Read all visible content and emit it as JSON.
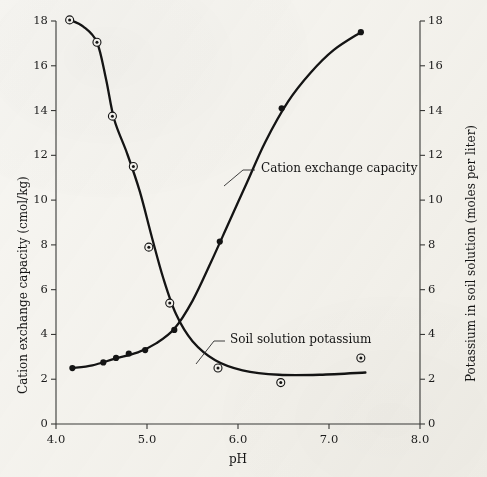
{
  "figure": {
    "background_color": "#f7f6f2",
    "ink_color": "#141414"
  },
  "axes": {
    "x": {
      "label": "pH",
      "min": 4.0,
      "max": 8.0,
      "ticks": [
        "4.0",
        "5.0",
        "6.0",
        "7.0",
        "8.0"
      ],
      "tick_values": [
        4.0,
        5.0,
        6.0,
        7.0,
        8.0
      ]
    },
    "y_left": {
      "label": "Cation exchange capacity (cmol/kg)",
      "min": 0,
      "max": 18,
      "ticks": [
        "0",
        "2",
        "4",
        "6",
        "8",
        "10",
        "12",
        "14",
        "16",
        "18"
      ],
      "tick_values": [
        0,
        2,
        4,
        6,
        8,
        10,
        12,
        14,
        16,
        18
      ]
    },
    "y_right": {
      "label": "Potassium in soil solution (moles per liter)",
      "min": 0,
      "max": 18,
      "ticks": [
        "0",
        "2",
        "4",
        "6",
        "8",
        "10",
        "12",
        "14",
        "16",
        "18"
      ],
      "tick_values": [
        0,
        2,
        4,
        6,
        8,
        10,
        12,
        14,
        16,
        18
      ]
    }
  },
  "annotations": {
    "cec": "Cation exchange capacity",
    "potassium": "Soil solution potassium"
  },
  "chart_data": {
    "type": "line",
    "title": "",
    "xlabel": "pH",
    "ylabel": "Cation exchange capacity (cmol/kg)",
    "y2label": "Potassium in soil solution (moles per liter)",
    "xlim": [
      4.0,
      8.0
    ],
    "ylim": [
      0,
      18
    ],
    "y2lim": [
      0,
      18
    ],
    "grid": false,
    "legend": "inline-annotations",
    "series": [
      {
        "name": "Cation exchange capacity",
        "axis": "left",
        "marker": "circle-dot",
        "marker_filled": false,
        "points": [
          {
            "x": 4.15,
            "y": 18.05
          },
          {
            "x": 4.45,
            "y": 17.05
          },
          {
            "x": 4.62,
            "y": 13.75
          },
          {
            "x": 4.85,
            "y": 11.5
          },
          {
            "x": 5.02,
            "y": 7.9
          },
          {
            "x": 5.25,
            "y": 5.4
          },
          {
            "x": 5.78,
            "y": 2.5
          },
          {
            "x": 6.47,
            "y": 1.85
          },
          {
            "x": 7.35,
            "y": 2.95
          }
        ],
        "curve": [
          {
            "x": 4.15,
            "y": 18.05
          },
          {
            "x": 4.3,
            "y": 17.75
          },
          {
            "x": 4.45,
            "y": 17.05
          },
          {
            "x": 4.55,
            "y": 15.4
          },
          {
            "x": 4.64,
            "y": 13.6
          },
          {
            "x": 4.78,
            "y": 12.1
          },
          {
            "x": 4.92,
            "y": 10.4
          },
          {
            "x": 5.05,
            "y": 8.4
          },
          {
            "x": 5.18,
            "y": 6.5
          },
          {
            "x": 5.32,
            "y": 4.9
          },
          {
            "x": 5.5,
            "y": 3.7
          },
          {
            "x": 5.75,
            "y": 2.85
          },
          {
            "x": 6.05,
            "y": 2.4
          },
          {
            "x": 6.45,
            "y": 2.2
          },
          {
            "x": 6.9,
            "y": 2.2
          },
          {
            "x": 7.4,
            "y": 2.3
          }
        ]
      },
      {
        "name": "Soil solution potassium",
        "axis": "right",
        "marker": "dot",
        "marker_filled": true,
        "points": [
          {
            "x": 4.18,
            "y": 2.5
          },
          {
            "x": 4.52,
            "y": 2.75
          },
          {
            "x": 4.66,
            "y": 2.95
          },
          {
            "x": 4.8,
            "y": 3.15
          },
          {
            "x": 4.98,
            "y": 3.3
          },
          {
            "x": 5.3,
            "y": 4.2
          },
          {
            "x": 5.8,
            "y": 8.15
          },
          {
            "x": 6.48,
            "y": 14.1
          },
          {
            "x": 7.35,
            "y": 17.5
          }
        ],
        "curve": [
          {
            "x": 4.18,
            "y": 2.5
          },
          {
            "x": 4.4,
            "y": 2.62
          },
          {
            "x": 4.65,
            "y": 2.92
          },
          {
            "x": 4.9,
            "y": 3.2
          },
          {
            "x": 5.1,
            "y": 3.6
          },
          {
            "x": 5.3,
            "y": 4.25
          },
          {
            "x": 5.5,
            "y": 5.5
          },
          {
            "x": 5.7,
            "y": 7.2
          },
          {
            "x": 5.9,
            "y": 9.0
          },
          {
            "x": 6.1,
            "y": 10.8
          },
          {
            "x": 6.3,
            "y": 12.6
          },
          {
            "x": 6.55,
            "y": 14.4
          },
          {
            "x": 6.8,
            "y": 15.7
          },
          {
            "x": 7.05,
            "y": 16.7
          },
          {
            "x": 7.35,
            "y": 17.5
          }
        ]
      }
    ]
  }
}
